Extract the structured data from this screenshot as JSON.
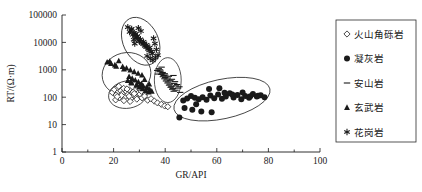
{
  "chart_data": {
    "type": "scatter",
    "title": "",
    "xlabel": "GR/API",
    "ylabel": "RT/(Ω·m)",
    "xlim": [
      0,
      100
    ],
    "ylim": [
      1,
      100000
    ],
    "yscale": "log",
    "xscale": "linear",
    "grid": false,
    "legend_position": "right",
    "xticks": [
      0,
      20,
      40,
      60,
      80,
      100
    ],
    "xtick_labels": [
      "0",
      "20",
      "40",
      "60",
      "80",
      "100"
    ],
    "xminor_ticks": [
      10,
      30,
      50,
      70,
      90
    ],
    "yticks": [
      1,
      10,
      100,
      1000,
      10000,
      100000
    ],
    "ytick_labels": [
      "1",
      "10",
      "100",
      "1000",
      "10000",
      "100000"
    ],
    "series": [
      {
        "name": "火山角砾岩",
        "marker": "open-diamond",
        "points": [
          [
            19.5,
            150
          ],
          [
            20.3,
            190
          ],
          [
            21.0,
            120
          ],
          [
            21.6,
            230
          ],
          [
            22.2,
            95
          ],
          [
            22.8,
            170
          ],
          [
            23.3,
            135
          ],
          [
            23.9,
            210
          ],
          [
            24.4,
            105
          ],
          [
            25.0,
            160
          ],
          [
            25.6,
            125
          ],
          [
            26.1,
            185
          ],
          [
            26.7,
            90
          ],
          [
            27.2,
            145
          ],
          [
            27.8,
            115
          ],
          [
            28.3,
            175
          ],
          [
            28.9,
            100
          ],
          [
            29.4,
            140
          ],
          [
            20.8,
            80
          ],
          [
            22.0,
            250
          ],
          [
            24.0,
            75
          ],
          [
            25.2,
            200
          ],
          [
            26.4,
            70
          ],
          [
            27.6,
            155
          ],
          [
            29.0,
            85
          ],
          [
            30.2,
            130
          ],
          [
            31.0,
            95
          ],
          [
            32.0,
            110
          ],
          [
            33.2,
            78
          ],
          [
            34.5,
            88
          ],
          [
            35.8,
            72
          ],
          [
            37.0,
            62
          ],
          [
            38.5,
            55
          ],
          [
            39.8,
            48
          ],
          [
            41.0,
            45
          ],
          [
            30.8,
            165
          ],
          [
            23.0,
            115
          ],
          [
            21.4,
            105
          ],
          [
            28.0,
            135
          ],
          [
            26.0,
            108
          ]
        ]
      },
      {
        "name": "凝灰岩",
        "marker": "filled-circle",
        "points": [
          [
            45.5,
            18
          ],
          [
            47.0,
            75
          ],
          [
            48.5,
            90
          ],
          [
            50.0,
            110
          ],
          [
            51.5,
            95
          ],
          [
            53.0,
            85
          ],
          [
            54.5,
            100
          ],
          [
            56.0,
            80
          ],
          [
            57.5,
            115
          ],
          [
            59.0,
            92
          ],
          [
            60.5,
            125
          ],
          [
            62.0,
            88
          ],
          [
            63.5,
            105
          ],
          [
            65.0,
            140
          ],
          [
            66.5,
            98
          ],
          [
            68.0,
            120
          ],
          [
            69.5,
            85
          ],
          [
            71.0,
            110
          ],
          [
            72.5,
            95
          ],
          [
            74.0,
            130
          ],
          [
            75.5,
            105
          ],
          [
            77.0,
            118
          ],
          [
            78.5,
            100
          ],
          [
            57.0,
            200
          ],
          [
            61.0,
            210
          ],
          [
            50.5,
            35
          ],
          [
            54.0,
            30
          ],
          [
            58.0,
            28
          ],
          [
            47.5,
            40
          ],
          [
            66.0,
            125
          ],
          [
            70.0,
            150
          ],
          [
            73.0,
            108
          ],
          [
            76.0,
            112
          ],
          [
            52.0,
            55
          ],
          [
            63.0,
            145
          ]
        ]
      },
      {
        "name": "安山岩",
        "marker": "dash",
        "points": [
          [
            37.5,
            1100
          ],
          [
            38.2,
            900
          ],
          [
            38.8,
            750
          ],
          [
            39.4,
            620
          ],
          [
            40.0,
            520
          ],
          [
            40.6,
            430
          ],
          [
            41.2,
            360
          ],
          [
            41.8,
            300
          ],
          [
            42.4,
            250
          ],
          [
            43.0,
            210
          ],
          [
            37.8,
            850
          ],
          [
            38.5,
            680
          ],
          [
            39.1,
            560
          ],
          [
            39.7,
            470
          ],
          [
            40.3,
            390
          ],
          [
            40.9,
            330
          ],
          [
            41.5,
            275
          ],
          [
            42.1,
            230
          ],
          [
            42.7,
            195
          ],
          [
            43.3,
            165
          ],
          [
            38.0,
            1000
          ],
          [
            39.0,
            800
          ],
          [
            40.0,
            640
          ],
          [
            41.0,
            500
          ],
          [
            42.0,
            400
          ],
          [
            43.5,
            320
          ],
          [
            44.2,
            260
          ],
          [
            45.0,
            215
          ],
          [
            38.6,
            1250
          ],
          [
            39.8,
            720
          ],
          [
            41.4,
            580
          ],
          [
            42.6,
            450
          ],
          [
            43.8,
            370
          ],
          [
            44.6,
            290
          ],
          [
            45.5,
            240
          ],
          [
            36.9,
            950
          ],
          [
            37.2,
            700
          ],
          [
            44.0,
            180
          ],
          [
            45.8,
            150
          ],
          [
            43.2,
            620
          ]
        ]
      },
      {
        "name": "玄武岩",
        "marker": "filled-triangle",
        "points": [
          [
            17.5,
            1900
          ],
          [
            19.0,
            1700
          ],
          [
            20.5,
            1500
          ],
          [
            22.0,
            2100
          ],
          [
            23.5,
            1300
          ],
          [
            25.0,
            1150
          ],
          [
            26.5,
            980
          ],
          [
            28.0,
            850
          ],
          [
            29.5,
            740
          ],
          [
            31.0,
            640
          ],
          [
            26.0,
            560
          ],
          [
            27.2,
            480
          ],
          [
            28.4,
            420
          ],
          [
            29.6,
            360
          ],
          [
            30.8,
            310
          ],
          [
            28.8,
            270
          ],
          [
            30.0,
            235
          ],
          [
            31.2,
            200
          ],
          [
            32.4,
            175
          ],
          [
            33.6,
            155
          ],
          [
            27.0,
            330
          ],
          [
            29.0,
            290
          ],
          [
            31.5,
            250
          ],
          [
            32.8,
            215
          ],
          [
            34.0,
            190
          ],
          [
            25.5,
            400
          ],
          [
            26.8,
            350
          ],
          [
            30.4,
            280
          ],
          [
            33.0,
            230
          ],
          [
            34.8,
            165
          ],
          [
            24.0,
            1050
          ],
          [
            21.0,
            1350
          ],
          [
            18.5,
            2000
          ],
          [
            32.0,
            440
          ],
          [
            33.8,
            300
          ]
        ]
      },
      {
        "name": "花岗岩",
        "marker": "asterisk",
        "points": [
          [
            25.5,
            36000
          ],
          [
            26.8,
            28000
          ],
          [
            28.0,
            22000
          ],
          [
            29.2,
            17000
          ],
          [
            30.4,
            13000
          ],
          [
            31.6,
            10500
          ],
          [
            32.8,
            8200
          ],
          [
            34.0,
            6500
          ],
          [
            26.2,
            24000
          ],
          [
            27.4,
            19000
          ],
          [
            28.6,
            15000
          ],
          [
            29.8,
            12000
          ],
          [
            31.0,
            9500
          ],
          [
            32.2,
            7500
          ],
          [
            33.4,
            5800
          ],
          [
            34.6,
            4600
          ],
          [
            27.0,
            31000
          ],
          [
            28.4,
            20000
          ],
          [
            29.0,
            16000
          ],
          [
            30.0,
            11000
          ],
          [
            31.4,
            8800
          ],
          [
            32.6,
            6800
          ],
          [
            33.8,
            5200
          ],
          [
            35.0,
            4000
          ],
          [
            36.0,
            9000
          ],
          [
            36.6,
            5500
          ],
          [
            37.2,
            3400
          ],
          [
            35.5,
            14000
          ],
          [
            36.2,
            2800
          ],
          [
            30.6,
            26000
          ],
          [
            29.6,
            33000
          ],
          [
            33.0,
            3200
          ],
          [
            34.2,
            2600
          ],
          [
            35.2,
            2200
          ],
          [
            28.2,
            9000
          ],
          [
            27.8,
            12500
          ]
        ]
      }
    ],
    "clusters": [
      {
        "label": "花岗岩",
        "cx": 30.5,
        "cy": 11000,
        "rx": 6.8,
        "ry_dec": 0.92,
        "rot": -26
      },
      {
        "label": "玄武岩",
        "cx": 25.0,
        "cy": 700,
        "rx": 9.5,
        "ry_dec": 0.78,
        "rot": -13
      },
      {
        "label": "火山角砾岩",
        "cx": 25.5,
        "cy": 125,
        "rx": 7.5,
        "ry_dec": 0.5,
        "rot": -10
      },
      {
        "label": "安山岩",
        "cx": 41.0,
        "cy": 420,
        "rx": 5.2,
        "ry_dec": 0.82,
        "rot": 0
      },
      {
        "label": "凝灰岩",
        "cx": 62.0,
        "cy": 85,
        "rx": 19.0,
        "ry_dec": 0.72,
        "rot": -12
      }
    ]
  },
  "legend": {
    "items": [
      {
        "label": "火山角砾岩",
        "marker": "open-diamond"
      },
      {
        "label": "凝灰岩",
        "marker": "filled-circle"
      },
      {
        "label": "安山岩",
        "marker": "dash"
      },
      {
        "label": "玄武岩",
        "marker": "filled-triangle"
      },
      {
        "label": "花岗岩",
        "marker": "asterisk"
      }
    ]
  },
  "colors": {
    "ink": "#1a1a1a",
    "outline": "#2b2b2b",
    "background": "#ffffff"
  }
}
